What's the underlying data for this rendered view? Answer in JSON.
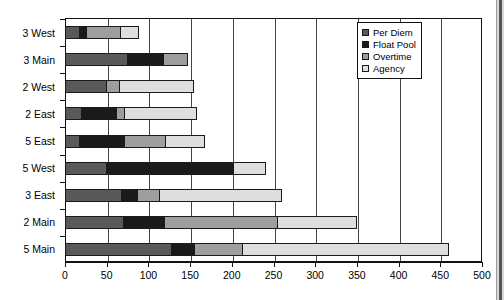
{
  "chart_data": {
    "type": "bar",
    "orientation": "horizontal",
    "stacked": true,
    "title": "",
    "subtitle": "",
    "xlabel": "",
    "ylabel": "",
    "xlim": [
      0,
      500
    ],
    "ylim": null,
    "grid": true,
    "grid_axis": "x",
    "legend_position": "top-right",
    "xticks": [
      0,
      50,
      100,
      150,
      200,
      250,
      300,
      350,
      400,
      450,
      500
    ],
    "xtick_labels": [
      "0",
      "50",
      "100",
      "150",
      "200",
      "250",
      "300",
      "350",
      "400",
      "450",
      "500"
    ],
    "categories": [
      "3 West",
      "3 Main",
      "2 West",
      "2 East",
      "5 East",
      "5 West",
      "3 East",
      "2 Main",
      "5 Main"
    ],
    "series": [
      {
        "name": "Per Diem",
        "color": "#595959",
        "values": [
          18,
          75,
          50,
          20,
          18,
          50,
          68,
          71,
          128
        ]
      },
      {
        "name": "Float Pool",
        "color": "#1a1a1a",
        "values": [
          10,
          45,
          0,
          44,
          55,
          154,
          21,
          50,
          29
        ]
      },
      {
        "name": "Overtime",
        "color": "#9e9e9e",
        "values": [
          42,
          30,
          17,
          10,
          51,
          0,
          27,
          137,
          59
        ]
      },
      {
        "name": "Agency",
        "color": "#dedede",
        "values": [
          22,
          0,
          90,
          88,
          48,
          39,
          148,
          96,
          248
        ]
      }
    ],
    "totals": [
      92,
      150,
      157,
      162,
      172,
      243,
      264,
      354,
      464
    ]
  },
  "legend": {
    "items": [
      {
        "label": "Per Diem",
        "color": "#595959"
      },
      {
        "label": "Float Pool",
        "color": "#1a1a1a"
      },
      {
        "label": "Overtime",
        "color": "#9e9e9e"
      },
      {
        "label": "Agency",
        "color": "#dedede"
      }
    ]
  }
}
